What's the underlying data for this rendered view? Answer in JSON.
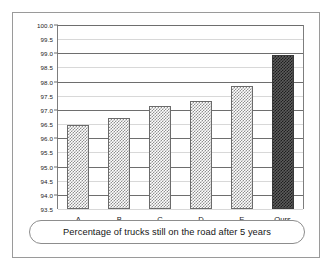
{
  "chart_data": {
    "type": "bar",
    "title": "",
    "subtitle": "",
    "caption": "Percentage of trucks still on the road after 5 years",
    "categories": [
      "A",
      "B",
      "C",
      "D",
      "E",
      "Ours"
    ],
    "values": [
      96.47,
      96.7,
      97.15,
      97.32,
      97.85,
      98.95
    ],
    "series": [
      {
        "name": "Percentage of trucks still on the road after 5 years",
        "values": [
          96.47,
          96.7,
          97.15,
          97.32,
          97.85,
          98.95
        ]
      }
    ],
    "xlabel": "",
    "ylabel": "",
    "ylim": [
      93.5,
      100.0
    ],
    "ytick_labels": [
      "100.0",
      "99.5",
      "99.0",
      "98.5",
      "98.0",
      "97.5",
      "97.0",
      "96.5",
      "96.0",
      "95.5",
      "95.0",
      "94.5",
      "94.0",
      "93.5"
    ],
    "ytick_values": [
      100.0,
      99.5,
      99.0,
      98.5,
      98.0,
      97.5,
      97.0,
      96.5,
      96.0,
      95.5,
      95.0,
      94.5,
      94.0,
      93.5
    ],
    "ytick_step": 0.5,
    "grid": true,
    "legend": "none",
    "highlight_category": "Ours",
    "bar_fill_pattern": "checkerboard",
    "colors": {
      "bar_fill": "#8f8f8f",
      "bar_border": "#6b6b6b",
      "highlight_fill": "#1e1e1e",
      "highlight_border": "#3a3a3a",
      "major_gridline": "#6e6e6e",
      "minor_gridline": "#d8d8d8",
      "frame": "#9a9a9a",
      "text": "#1a1a1a",
      "background": "#ffffff"
    }
  }
}
